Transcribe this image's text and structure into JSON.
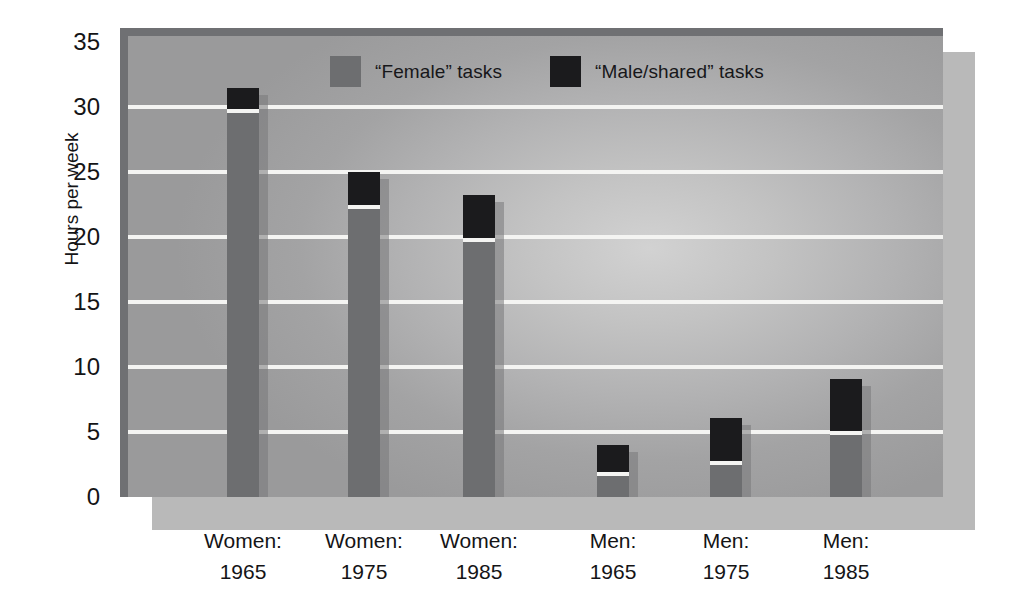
{
  "chart_data": {
    "type": "bar",
    "subtype": "stacked",
    "title": "",
    "xlabel": "",
    "ylabel": "Hours per week",
    "ylim": [
      0,
      35
    ],
    "yticks": [
      0,
      5,
      10,
      15,
      20,
      25,
      30,
      35
    ],
    "grid": true,
    "legend_position": "top-center",
    "categories": [
      "Women:\n1965",
      "Women:\n1975",
      "Women:\n1985",
      "Men:\n1965",
      "Men:\n1975",
      "Men:\n1985"
    ],
    "category_lines": [
      [
        "Women:",
        "1965"
      ],
      [
        "Women:",
        "1975"
      ],
      [
        "Women:",
        "1985"
      ],
      [
        "Men:",
        "1965"
      ],
      [
        "Men:",
        "1975"
      ],
      [
        "Men:",
        "1985"
      ]
    ],
    "series": [
      {
        "name": "“Female” tasks",
        "color": "#6d6e70",
        "values": [
          29.7,
          22.3,
          19.8,
          1.8,
          2.6,
          4.9
        ]
      },
      {
        "name": "“Male/shared” tasks",
        "color": "#1b1b1d",
        "values": [
          1.8,
          2.7,
          3.4,
          2.2,
          3.5,
          4.2
        ]
      }
    ],
    "totals": [
      31.5,
      25.0,
      23.2,
      4.0,
      6.1,
      9.1
    ]
  },
  "axes": {
    "y_title": "Hours per week",
    "y_ticks": [
      "35",
      "30",
      "25",
      "20",
      "15",
      "10",
      "5",
      "0"
    ],
    "x_ticks": [
      {
        "line1": "Women:",
        "line2": "1965"
      },
      {
        "line1": "Women:",
        "line2": "1975"
      },
      {
        "line1": "Women:",
        "line2": "1985"
      },
      {
        "line1": "Men:",
        "line2": "1965"
      },
      {
        "line1": "Men:",
        "line2": "1975"
      },
      {
        "line1": "Men:",
        "line2": "1985"
      }
    ]
  },
  "legend": {
    "entries": [
      {
        "label": "“Female” tasks",
        "color": "#6d6e70"
      },
      {
        "label": "“Male/shared” tasks",
        "color": "#1b1b1d"
      }
    ]
  },
  "colors": {
    "female_tasks": "#6d6e70",
    "male_shared_tasks": "#1b1b1d",
    "gridline": "#f4f4f2",
    "plot_frame": "#6f7073",
    "plot_shadow": "#b9b9b9",
    "page_background": "#ffffff"
  }
}
